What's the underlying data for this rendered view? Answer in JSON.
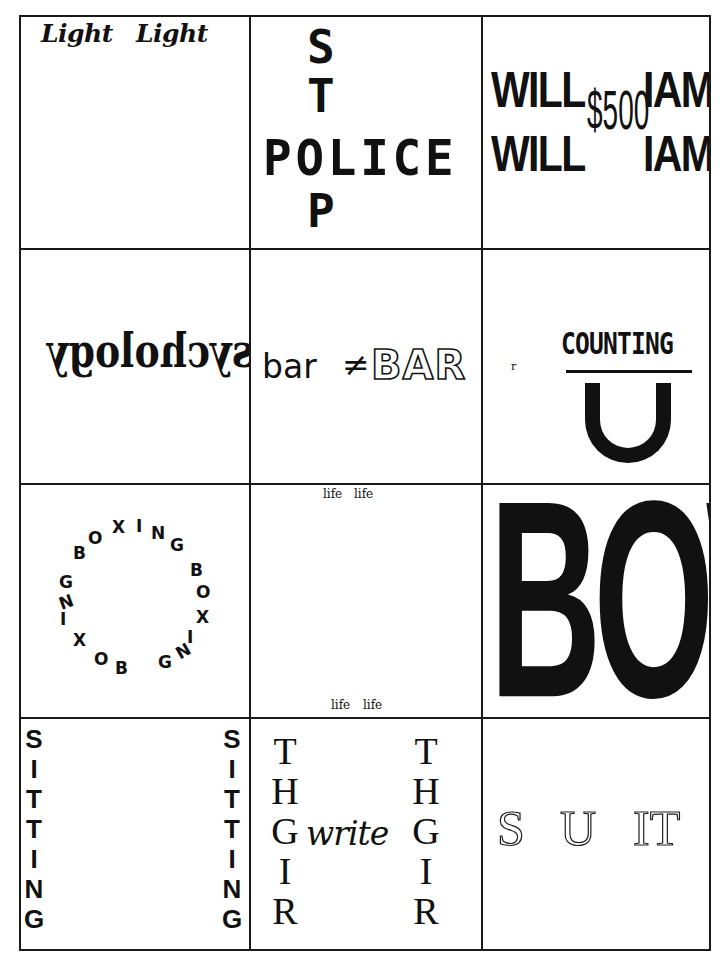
{
  "puzzle_grid": {
    "rows": 4,
    "columns": 3,
    "cells": [
      {
        "id": 1,
        "texts": [
          "Light",
          "Light"
        ]
      },
      {
        "id": 2,
        "vertical": [
          "S",
          "T",
          "O",
          "P"
        ],
        "horizontal": "POLICE"
      },
      {
        "id": 3,
        "left": [
          "WILL",
          "WILL"
        ],
        "center": "$500",
        "right": [
          "IAM",
          "IAM"
        ]
      },
      {
        "id": 4,
        "text": "Psychology",
        "mirrored": true
      },
      {
        "id": 5,
        "small": "bar",
        "operator": "≠",
        "big": "BAR"
      },
      {
        "id": 6,
        "marker": "r",
        "numerator": "COUNTING",
        "denominator": "U"
      },
      {
        "id": 7,
        "circle_letters": [
          "B",
          "O",
          "X",
          "I",
          "N",
          "G",
          "B",
          "O",
          "X",
          "I",
          "N",
          "G",
          "B",
          "O",
          "X",
          "I",
          "N",
          "G"
        ],
        "word": "BOXING"
      },
      {
        "id": 8,
        "top": [
          "life",
          "life"
        ],
        "bottom": [
          "life",
          "life"
        ]
      },
      {
        "id": 9,
        "text": "BOWL"
      },
      {
        "id": 10,
        "left": [
          "S",
          "I",
          "T",
          "T",
          "I",
          "N",
          "G"
        ],
        "right": [
          "S",
          "I",
          "T",
          "T",
          "I",
          "N",
          "G"
        ]
      },
      {
        "id": 11,
        "left": [
          "T",
          "H",
          "G",
          "I",
          "R"
        ],
        "middle": "write",
        "right": [
          "T",
          "H",
          "G",
          "I",
          "R"
        ]
      },
      {
        "id": 12,
        "parts": [
          "S",
          "U",
          "IT"
        ]
      }
    ]
  }
}
